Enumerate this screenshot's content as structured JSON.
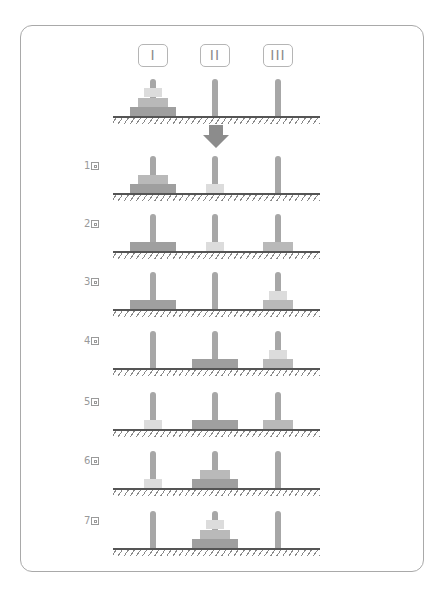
{
  "peg_labels": [
    "I",
    "II",
    "III"
  ],
  "colors": {
    "frame": "#a9a9a9",
    "peg": "#a7a7a7",
    "disk_small": "#dcdcdc",
    "disk_medium": "#b9b9b9",
    "disk_large": "#9f9f9f",
    "arrow": "#8c8c8c",
    "ground": "#555555"
  },
  "initial_state": {
    "pegs": [
      [
        3,
        2,
        1
      ],
      [],
      []
    ]
  },
  "arrow": {
    "icon": "down-arrow-icon"
  },
  "steps": [
    {
      "label": "1",
      "suffix_icon": "kanji-kai-icon",
      "pegs": [
        [
          3,
          2
        ],
        [
          1
        ],
        []
      ]
    },
    {
      "label": "2",
      "suffix_icon": "kanji-kai-icon",
      "pegs": [
        [
          3
        ],
        [
          1
        ],
        [
          2
        ]
      ]
    },
    {
      "label": "3",
      "suffix_icon": "kanji-kai-icon",
      "pegs": [
        [
          3
        ],
        [],
        [
          2,
          1
        ]
      ]
    },
    {
      "label": "4",
      "suffix_icon": "kanji-kai-icon",
      "pegs": [
        [],
        [
          3
        ],
        [
          2,
          1
        ]
      ]
    },
    {
      "label": "5",
      "suffix_icon": "kanji-kai-icon",
      "pegs": [
        [
          1
        ],
        [
          3
        ],
        [
          2
        ]
      ]
    },
    {
      "label": "6",
      "suffix_icon": "kanji-kai-icon",
      "pegs": [
        [
          1
        ],
        [
          3,
          2
        ],
        []
      ]
    },
    {
      "label": "7",
      "suffix_icon": "kanji-kai-icon",
      "pegs": [
        [],
        [
          3,
          2,
          1
        ],
        []
      ]
    }
  ]
}
